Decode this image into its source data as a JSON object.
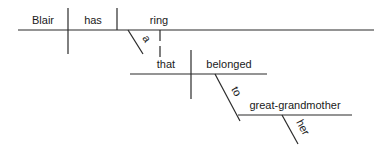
{
  "diagram": {
    "type": "sentence-diagram",
    "sentence": "Blair has a ring that belonged to her great-grandmother",
    "words": {
      "subject": "Blair",
      "verb": "has",
      "object": "ring",
      "article": "a",
      "relative_pronoun": "that",
      "relative_verb": "belonged",
      "preposition": "to",
      "prep_object": "great-grandmother",
      "possessive": "her"
    }
  }
}
